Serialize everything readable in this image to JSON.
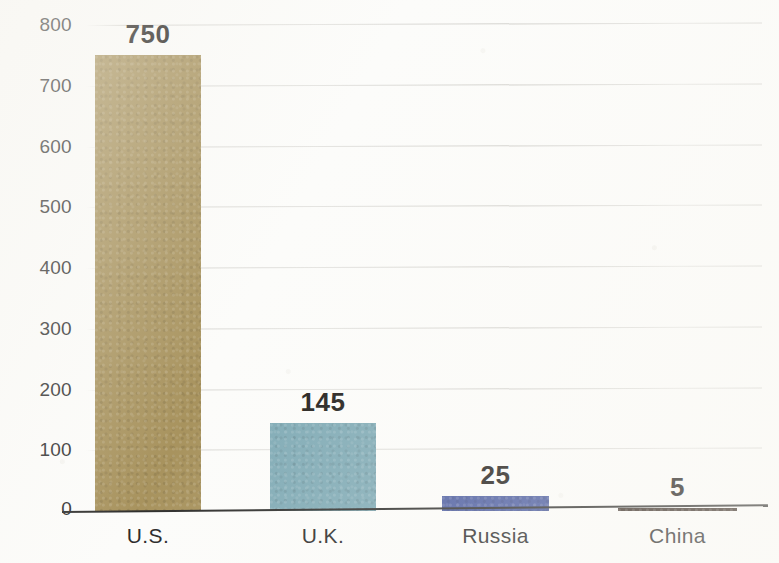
{
  "chart_data": {
    "type": "bar",
    "title": "",
    "subtitle": "",
    "xlabel": "",
    "ylabel": "",
    "categories": [
      "U.S.",
      "U.K.",
      "Russia",
      "China"
    ],
    "values": [
      750,
      145,
      25,
      5
    ],
    "value_labels": [
      "750",
      "145",
      "25",
      "5"
    ],
    "colors": [
      "#a8935e",
      "#7faab5",
      "#4a5ba0",
      "#3a2e26"
    ],
    "ylim": [
      0,
      800
    ],
    "ytick_values": [
      0,
      100,
      200,
      300,
      400,
      500,
      600,
      700,
      800
    ],
    "ytick_labels": [
      "0",
      "100",
      "200",
      "300",
      "400",
      "500",
      "600",
      "700",
      "800"
    ],
    "grid": true,
    "legend": false,
    "legend_position": "none",
    "orientation": "vertical",
    "background_color": "#fcfcfa",
    "axis_color": "#30302e",
    "label_color": "#231f1c"
  }
}
